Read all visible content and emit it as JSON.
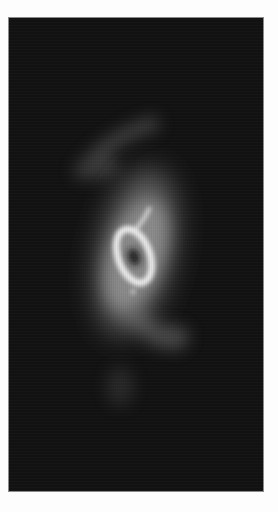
{
  "image": {
    "subject": "astronomical object",
    "description": "grayscale image of a bright elliptical ring with a dark center, surrounded by a diffuse glow and faint arcs above and below, on a dark background",
    "colors": {
      "page_background": "#fdfdfd",
      "frame_border": "#8a8a8a",
      "sky_background": "#111111",
      "ring_highlight": "#f2f2f2",
      "glow": "#9a9a9a",
      "core": "#1a1a1a"
    }
  }
}
